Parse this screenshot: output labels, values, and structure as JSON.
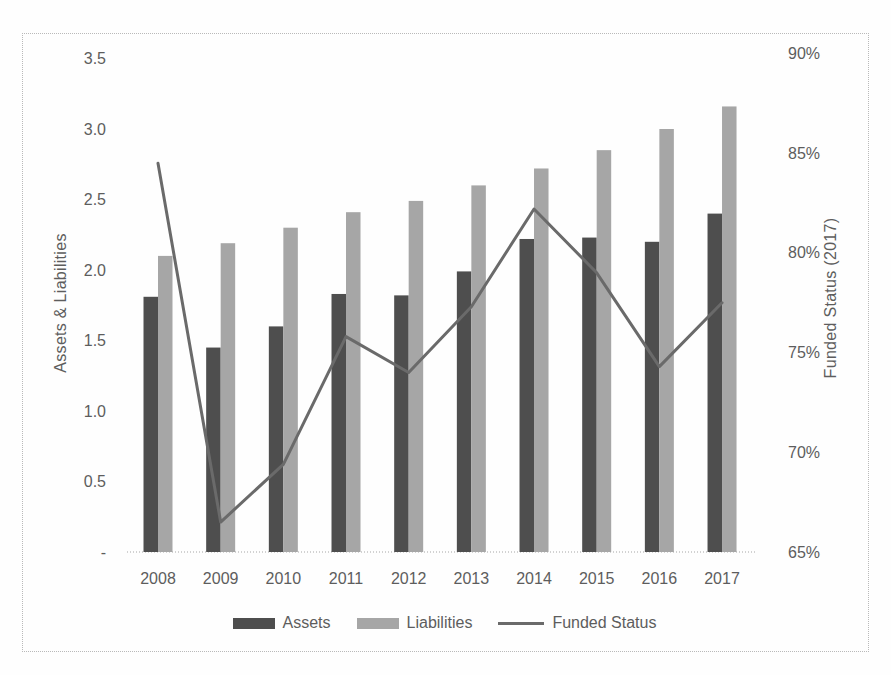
{
  "chart_data": {
    "type": "bar+line",
    "categories": [
      "2008",
      "2009",
      "2010",
      "2011",
      "2012",
      "2013",
      "2014",
      "2015",
      "2016",
      "2017"
    ],
    "series": [
      {
        "name": "Assets",
        "type": "bar",
        "axis": "left",
        "color": "#4e4e4e",
        "values": [
          1.81,
          1.45,
          1.6,
          1.83,
          1.82,
          1.99,
          2.22,
          2.23,
          2.2,
          2.4
        ]
      },
      {
        "name": "Liabilities",
        "type": "bar",
        "axis": "left",
        "color": "#a6a6a6",
        "values": [
          2.1,
          2.19,
          2.3,
          2.41,
          2.49,
          2.6,
          2.72,
          2.85,
          3.0,
          3.16
        ]
      },
      {
        "name": "Funded Status",
        "type": "line",
        "axis": "right",
        "color": "#6a6a6a",
        "values": [
          84.5,
          66.5,
          69.4,
          75.8,
          74.0,
          77.3,
          82.2,
          79.0,
          74.3,
          77.5
        ]
      }
    ],
    "left_axis": {
      "title": "Assets & Liabilities",
      "range": [
        0,
        3.5
      ],
      "ticks": [
        3.5,
        3.0,
        2.5,
        2.0,
        1.5,
        1.0,
        0.5,
        0
      ],
      "tick_labels": [
        "3.5",
        "3.0",
        "2.5",
        "2.0",
        "1.5",
        "1.0",
        "0.5",
        "-"
      ]
    },
    "right_axis": {
      "title": "Funded Status (2017)",
      "range": [
        65,
        90
      ],
      "ticks": [
        90,
        85,
        80,
        75,
        70,
        65
      ],
      "tick_labels": [
        "90%",
        "85%",
        "80%",
        "75%",
        "70%",
        "65%"
      ]
    },
    "legend": {
      "position": "bottom",
      "entries": [
        "Assets",
        "Liabilities",
        "Funded Status"
      ]
    },
    "grid": false,
    "title": ""
  }
}
